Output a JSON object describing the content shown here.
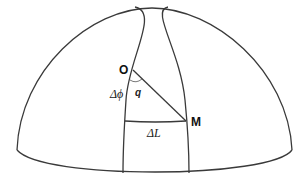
{
  "diagram": {
    "title": "",
    "labels": {
      "origin": "O",
      "destination": "M",
      "delta_phi": "Δϕ",
      "angle": "q",
      "delta_L": "ΔL"
    },
    "colors": {
      "line": "#3a3a3a",
      "background": "#ffffff"
    },
    "elements": [
      "hemisphere-outline",
      "equator-ellipse",
      "meridian-through-O",
      "meridian-through-M",
      "great-circle-OM",
      "parallel-arc-deltaL",
      "angle-arc-q"
    ]
  }
}
